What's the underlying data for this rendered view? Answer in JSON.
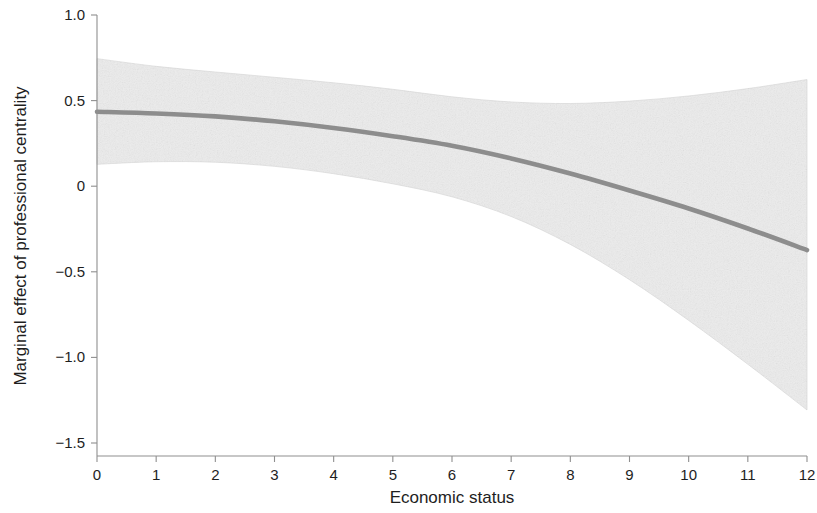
{
  "chart_data": {
    "type": "line",
    "title": "",
    "subtitle": "",
    "xlabel": "Economic status",
    "ylabel": "Marginal effect of professional centrality",
    "xlim": [
      0,
      12
    ],
    "ylim": [
      -1.5,
      1.0
    ],
    "xticks": [
      0,
      1,
      2,
      3,
      4,
      5,
      6,
      7,
      8,
      9,
      10,
      11,
      12
    ],
    "xticklabels": [
      "0",
      "1",
      "2",
      "3",
      "4",
      "5",
      "6",
      "7",
      "8",
      "9",
      "10",
      "11",
      "12"
    ],
    "yticks": [
      1.0,
      0.5,
      0,
      -0.5,
      -1.0,
      -1.5
    ],
    "yticklabels": [
      "1.0",
      "0.5",
      "0",
      "-0.5",
      "-1.0",
      "-1.5"
    ],
    "grid": false,
    "legend": null,
    "annotations": [],
    "x": [
      0,
      1,
      2,
      3,
      4,
      5,
      6,
      7,
      8,
      9,
      10,
      11,
      12
    ],
    "series": [
      {
        "name": "Marginal effect (fit)",
        "kind": "line",
        "color": "#8d8d8d",
        "values": [
          0.435,
          0.425,
          0.408,
          0.379,
          0.34,
          0.292,
          0.236,
          0.162,
          0.074,
          -0.025,
          -0.13,
          -0.247,
          -0.373
        ]
      },
      {
        "name": "95% confidence interval — upper",
        "kind": "band-edge",
        "color": "#ececec",
        "values": [
          0.745,
          0.7,
          0.667,
          0.636,
          0.604,
          0.566,
          0.522,
          0.492,
          0.483,
          0.497,
          0.527,
          0.57,
          0.623
        ]
      },
      {
        "name": "95% confidence interval — lower",
        "kind": "band-edge",
        "color": "#ececec",
        "values": [
          0.128,
          0.143,
          0.14,
          0.116,
          0.073,
          0.014,
          -0.062,
          -0.177,
          -0.34,
          -0.546,
          -0.784,
          -1.04,
          -1.307
        ]
      }
    ]
  },
  "figure": {
    "background_color": "#ffffff",
    "band_color": "#ececec",
    "line_color": "#8d8d8d",
    "axis_color": "#8f8f8f",
    "text_color": "#1e1e1e"
  }
}
